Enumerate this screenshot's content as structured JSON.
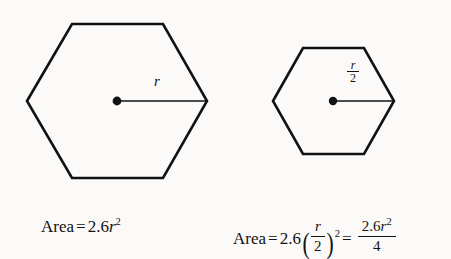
{
  "figure": {
    "background_color": "#fbfaf9",
    "stroke_color": "#121212",
    "shapes": [
      {
        "name": "large-hexagon",
        "orientation": "flat-top",
        "center": [
          117,
          101
        ],
        "left_vertex": [
          27,
          101
        ],
        "right_vertex": [
          207,
          101
        ],
        "top_edge_y": 24,
        "bottom_edge_y": 178,
        "radius_label": "r"
      },
      {
        "name": "small-hexagon",
        "orientation": "flat-top",
        "center": [
          333,
          101
        ],
        "left_vertex": [
          273,
          101
        ],
        "right_vertex": [
          394,
          101
        ],
        "top_edge_y": 48,
        "bottom_edge_y": 154,
        "radius_label_numerator": "r",
        "radius_label_denominator": "2"
      }
    ]
  },
  "labels": {
    "large_radius": "r",
    "small_radius_numerator": "r",
    "small_radius_denominator": "2"
  },
  "captions": {
    "large": {
      "area_word": "Area",
      "equals": "=",
      "coefficient": "2.6",
      "variable": "r",
      "exponent": "2",
      "full_text": "Area = 2.6r²"
    },
    "small": {
      "area_word": "Area",
      "equals_first": "=",
      "coefficient": "2.6",
      "paren_open": "(",
      "inner_numerator": "r",
      "inner_denominator": "2",
      "paren_close": ")",
      "paren_exponent": "2",
      "equals_second": "=",
      "result_numerator_coefficient": "2.6",
      "result_numerator_variable": "r",
      "result_numerator_exponent": "2",
      "result_denominator": "4",
      "full_text": "Area = 2.6(r/2)² = 2.6r²/4"
    }
  }
}
